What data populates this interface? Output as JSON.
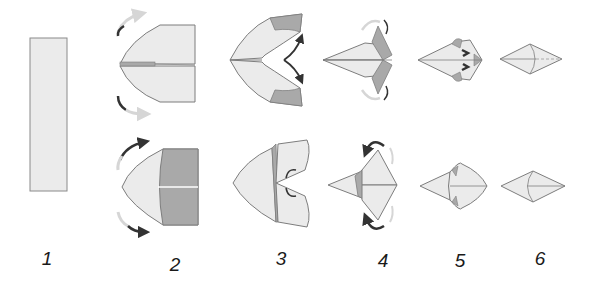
{
  "diagram": {
    "colors": {
      "paper_light": "#ebebeb",
      "paper_dark": "#a9a9a9",
      "paper_mid": "#c4c4c4",
      "edge": "#7d7d7d",
      "arrow_dark": "#333333",
      "arrow_light": "#d6d6d6",
      "background": "#ffffff"
    },
    "steps": [
      {
        "label": "1",
        "x": 47,
        "y": 248
      },
      {
        "label": "2",
        "x": 175,
        "y": 254
      },
      {
        "label": "3",
        "x": 281,
        "y": 248
      },
      {
        "label": "4",
        "x": 383,
        "y": 250
      },
      {
        "label": "5",
        "x": 460,
        "y": 250
      },
      {
        "label": "6",
        "x": 540,
        "y": 248
      }
    ]
  }
}
